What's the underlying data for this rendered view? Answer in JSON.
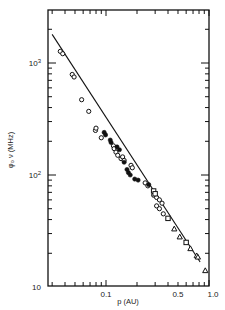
{
  "chart_data": {
    "type": "scatter",
    "title": "",
    "xlabel": "p (AU)",
    "ylabel": "φ₀ ν (MHz)",
    "xscale": "log",
    "yscale": "log",
    "xlim": [
      0.027,
      1.0
    ],
    "ylim": [
      10,
      3000
    ],
    "grid": false,
    "legend": "none",
    "x_tick_labels": [
      {
        "value": 0.1,
        "label": "0.1"
      },
      {
        "value": 0.5,
        "label": "0.5"
      },
      {
        "value": 1.0,
        "label": "1.0"
      }
    ],
    "y_tick_labels": [
      {
        "value": 10,
        "label": "10"
      },
      {
        "value": 100,
        "label": "10²"
      },
      {
        "value": 1000,
        "label": "10³"
      }
    ],
    "fit_line": {
      "x": [
        0.03,
        0.82
      ],
      "y": [
        1800,
        16.7
      ],
      "style": "solid"
    },
    "series": [
      {
        "name": "open circles",
        "marker": "circle-open",
        "points": [
          [
            0.036,
            1270
          ],
          [
            0.038,
            1210
          ],
          [
            0.047,
            790
          ],
          [
            0.049,
            750
          ],
          [
            0.058,
            470
          ],
          [
            0.068,
            370
          ],
          [
            0.079,
            250
          ],
          [
            0.08,
            262
          ],
          [
            0.09,
            215
          ],
          [
            0.118,
            182
          ],
          [
            0.12,
            172
          ],
          [
            0.125,
            160
          ],
          [
            0.13,
            150
          ],
          [
            0.14,
            140
          ],
          [
            0.145,
            145
          ],
          [
            0.15,
            135
          ],
          [
            0.175,
            122
          ],
          [
            0.18,
            116
          ],
          [
            0.24,
            85
          ],
          [
            0.255,
            80
          ],
          [
            0.29,
            66
          ],
          [
            0.31,
            63
          ],
          [
            0.33,
            60
          ],
          [
            0.35,
            56
          ],
          [
            0.31,
            53
          ],
          [
            0.33,
            50
          ],
          [
            0.36,
            45
          ]
        ]
      },
      {
        "name": "filled circles",
        "marker": "circle-filled",
        "points": [
          [
            0.096,
            240
          ],
          [
            0.099,
            228
          ],
          [
            0.11,
            205
          ],
          [
            0.112,
            195
          ],
          [
            0.128,
            178
          ],
          [
            0.135,
            168
          ],
          [
            0.15,
            130
          ],
          [
            0.16,
            112
          ],
          [
            0.165,
            105
          ],
          [
            0.172,
            100
          ],
          [
            0.19,
            92
          ],
          [
            0.205,
            90
          ],
          [
            0.26,
            82
          ]
        ]
      },
      {
        "name": "open squares",
        "marker": "square-open",
        "points": [
          [
            0.29,
            72
          ],
          [
            0.3,
            68
          ],
          [
            0.4,
            41
          ],
          [
            0.6,
            25
          ]
        ]
      },
      {
        "name": "open triangles",
        "marker": "triangle-open",
        "points": [
          [
            0.46,
            33
          ],
          [
            0.52,
            28
          ],
          [
            0.66,
            22
          ],
          [
            0.76,
            19
          ],
          [
            0.78,
            18.5
          ],
          [
            0.92,
            14
          ]
        ]
      }
    ]
  },
  "plot_frame": {
    "left_px": 48,
    "right_px": 209,
    "top_px": 10,
    "bottom_px": 286,
    "x_px_per_decade": 103,
    "x_ref": {
      "value": 0.1,
      "px": 106
    },
    "y_px_per_decade": 112,
    "y_ref": {
      "value": 1000,
      "px": 63
    }
  },
  "colors": {
    "ink": "#111111",
    "background": "#ffffff"
  }
}
